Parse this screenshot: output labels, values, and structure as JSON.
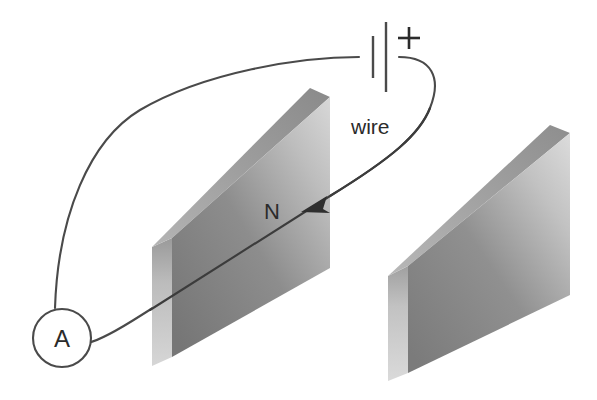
{
  "figure": {
    "background_color": "#ffffff",
    "line_color": "#4a4a4a"
  },
  "labels": {
    "wire": "wire",
    "plate_left": "N",
    "ammeter": "A",
    "battery_polarity": "+"
  },
  "components": {
    "battery": {
      "name": "battery",
      "polarity_sign": "+",
      "negative_plate_x": 373,
      "positive_plate_x": 386
    },
    "ammeter": {
      "name": "ammeter",
      "symbol": "A",
      "center_x": 62,
      "center_y": 338,
      "radius": 29
    },
    "plate_left": {
      "name": "left-plate",
      "label": "N",
      "face_color_light": "#c9c9c9",
      "face_color_dark": "#7a7a7a",
      "edge_color": "#b5b5b5",
      "top_color": "#8f8f8f"
    },
    "plate_right": {
      "name": "right-plate",
      "label": "",
      "face_color_light": "#cfcfcf",
      "face_color_dark": "#7e7e7e",
      "edge_color": "#bdbdbd",
      "top_color": "#949494"
    },
    "current_arrow": {
      "name": "current-direction-arrow",
      "direction": "leftward-into-left-plate"
    }
  },
  "colors": {
    "stroke": "#4a4a4a",
    "text": "#2b2b2b",
    "white": "#ffffff"
  }
}
